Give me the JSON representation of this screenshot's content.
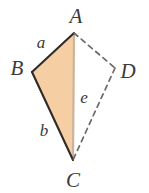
{
  "figure": {
    "type": "geometry-diagram",
    "background_color": "#ffffff",
    "fill_color": "#f5cfa3",
    "solid_stroke_color": "#2e2a26",
    "median_stroke_color": "#cbb49c",
    "dashed_stroke_color": "#6d6a66",
    "label_color": "#3b3b3b",
    "vertices": [
      {
        "id": "A",
        "label": "A",
        "x": 74,
        "y": 33,
        "label_x": 76,
        "label_y": 16
      },
      {
        "id": "B",
        "label": "B",
        "x": 32,
        "y": 72,
        "label_x": 17,
        "label_y": 68
      },
      {
        "id": "C",
        "label": "C",
        "x": 73,
        "y": 160,
        "label_x": 73,
        "label_y": 180
      },
      {
        "id": "D",
        "label": "D",
        "x": 115,
        "y": 68,
        "label_x": 128,
        "label_y": 71
      }
    ],
    "side_labels": [
      {
        "id": "a",
        "label": "a",
        "x": 41,
        "y": 42,
        "segment": "AB"
      },
      {
        "id": "b",
        "label": "b",
        "x": 44,
        "y": 130,
        "segment": "BC"
      },
      {
        "id": "e",
        "label": "e",
        "x": 84,
        "y": 97,
        "segment": "AC"
      }
    ],
    "solid_edges": [
      {
        "id": "AB",
        "from": "A",
        "to": "B"
      },
      {
        "id": "BC",
        "from": "B",
        "to": "C"
      }
    ],
    "light_edges": [
      {
        "id": "AC",
        "from": "A",
        "to": "C"
      }
    ],
    "dashed_edges": [
      {
        "id": "AD",
        "from": "A",
        "to": "D"
      },
      {
        "id": "DC",
        "from": "D",
        "to": "C"
      }
    ],
    "shaded_region": {
      "id": "triangle-ABC",
      "points": "74,33 32,72 73,160"
    }
  }
}
